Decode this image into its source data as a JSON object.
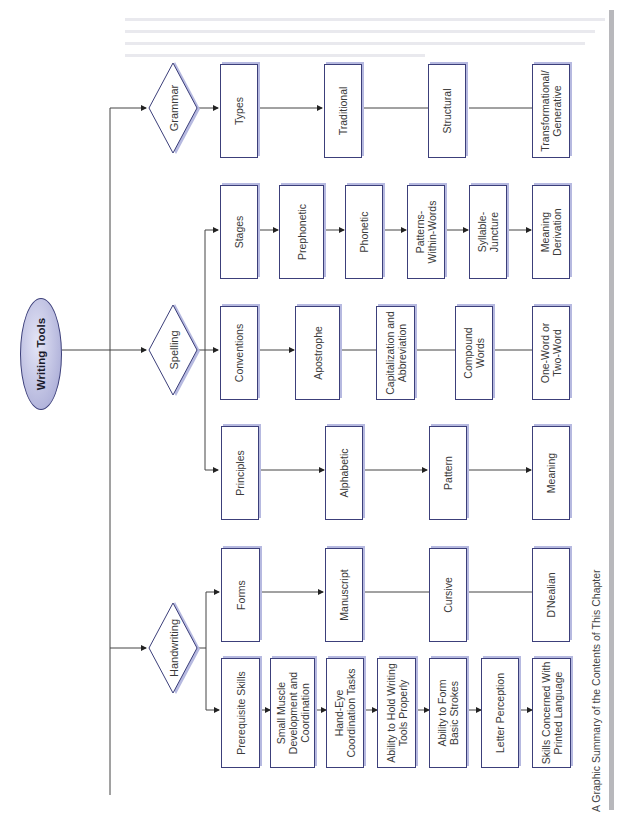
{
  "root": {
    "label": "Writing Tools"
  },
  "branches": {
    "grammar": {
      "label": "Grammar",
      "types": {
        "label": "Types",
        "items": [
          "Traditional",
          "Structural",
          "Transformational/\nGenerative"
        ]
      }
    },
    "spelling": {
      "label": "Spelling",
      "stages": {
        "label": "Stages",
        "items": [
          "Prephonetic",
          "Phonetic",
          "Patterns-\nWithin-Words",
          "Syllable-\nJuncture",
          "Meaning\nDerivation"
        ]
      },
      "conventions": {
        "label": "Conventions",
        "items": [
          "Apostrophe",
          "Capitalization and\nAbbreviation",
          "Compound\nWords",
          "One-Word or\nTwo-Word"
        ]
      },
      "principles": {
        "label": "Principles",
        "items": [
          "Alphabetic",
          "Pattern",
          "Meaning"
        ]
      }
    },
    "handwriting": {
      "label": "Handwriting",
      "forms": {
        "label": "Forms",
        "items": [
          "Manuscript",
          "Cursive",
          "D'Nealian"
        ]
      },
      "prerequisite_skills": {
        "label": "Prerequisite Skills",
        "items": [
          "Small Muscle\nDevelopment and\nCoordination",
          "Hand-Eye\nCoordination Tasks",
          "Ability to Hold Writing\nTools Properly",
          "Ability to Form\nBasic Strokes",
          "Letter Perception",
          "Skills Concerned With\nPrinted Language"
        ]
      }
    }
  },
  "caption": "A Graphic Summary of the Contents of This Chapter",
  "colors": {
    "box_border": "#3c3f7a",
    "box_shadow": "#b6b9e0",
    "oval_fill": "#b4b6dc",
    "rule": "#b8b8bc"
  }
}
